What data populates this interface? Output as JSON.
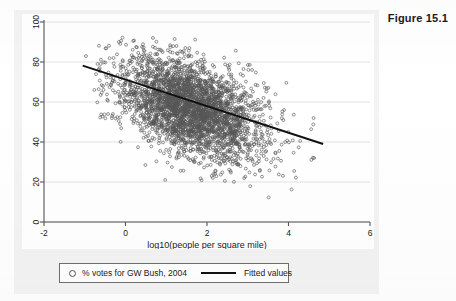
{
  "figure": {
    "title": "Figure 15.1"
  },
  "legend": {
    "scatter_label": "% votes for GW Bush, 2004",
    "scatter_marker": "open-circle-marker",
    "line_label": "Fitted values",
    "line_marker": "solid-line-marker"
  },
  "colors": {
    "marker": "#555555",
    "fit_line": "#111111",
    "gridline": "#e2e2e2",
    "axis": "#555555",
    "panel_bg": "#f3f3f3",
    "plot_bg": "#ffffff",
    "text": "#1a1a1a"
  },
  "chart_data": {
    "type": "scatter",
    "title": "",
    "xlabel": "log10(people per square mile)",
    "ylabel": "",
    "xlim": [
      -2,
      6
    ],
    "ylim": [
      0,
      100
    ],
    "xticks": [
      -2,
      0,
      2,
      4,
      6
    ],
    "yticks": [
      0,
      20,
      40,
      60,
      80,
      100
    ],
    "xtick_labels": [
      "-2",
      "0",
      "2",
      "4",
      "6"
    ],
    "ytick_labels": [
      "0",
      "20",
      "40",
      "60",
      "80",
      "100"
    ],
    "grid": "horizontal",
    "legend_position": "below-axes",
    "series": [
      {
        "name": "% votes for GW Bush, 2004",
        "type": "scatter",
        "marker": "open-circle",
        "n_points": 3100,
        "x_range": [
          -1.05,
          4.75
        ],
        "y_range": [
          10,
          93
        ],
        "cloud": {
          "x_mean": 1.55,
          "x_sd": 0.85,
          "y_mean_at_x0": 68,
          "slope": -6.6,
          "residual_sd": 11.5
        }
      },
      {
        "name": "Fitted values",
        "type": "line",
        "x": [
          -1.05,
          4.85
        ],
        "y": [
          78.2,
          39.0
        ],
        "slope": -6.64,
        "intercept": 71.2
      }
    ]
  }
}
